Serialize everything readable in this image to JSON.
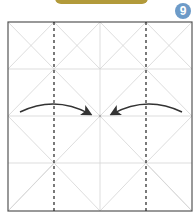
{
  "header": {
    "banner_color": "#b29a3a"
  },
  "step": {
    "number": "9",
    "badge_color": "#6d9bc8"
  },
  "diagram": {
    "type": "origami-fold-step",
    "square": {
      "x": 8,
      "y": 22,
      "width": 184,
      "height": 189,
      "border_color": "#555555"
    },
    "crease_color": "#cfcfcf",
    "valley_fold_lines": [
      {
        "x": 54,
        "style": "dashed"
      },
      {
        "x": 146,
        "style": "dashed"
      }
    ],
    "arrows": [
      {
        "name": "left-fold-arrow",
        "from": [
          20,
          112
        ],
        "to": [
          90,
          113
        ],
        "direction": "right"
      },
      {
        "name": "right-fold-arrow",
        "from": [
          182,
          112
        ],
        "to": [
          112,
          113
        ],
        "direction": "left"
      }
    ],
    "arrow_color": "#333333"
  }
}
